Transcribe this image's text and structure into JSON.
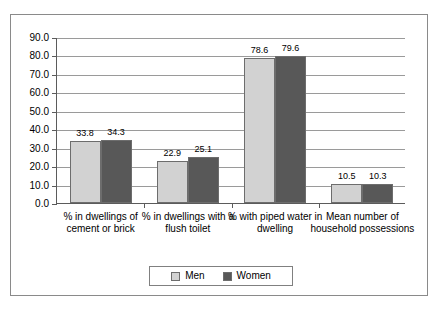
{
  "chart_data": {
    "type": "bar",
    "title": "",
    "subtitle": "",
    "xlabel": "",
    "ylabel": "",
    "ylim": [
      0,
      90
    ],
    "ytick_step": 10,
    "grid": true,
    "legend_position": "bottom",
    "categories": [
      "% in dwellings of cement or brick",
      "% in dwellings with a flush toilet",
      "% with piped water in dwelling",
      "Mean number of household possessions"
    ],
    "ytick_labels": [
      "90.0",
      "80.0",
      "70.0",
      "60.0",
      "50.0",
      "40.0",
      "30.0",
      "20.0",
      "10.0",
      "0.0"
    ],
    "ytick_values": [
      90,
      80,
      70,
      60,
      50,
      40,
      30,
      20,
      10,
      0
    ],
    "series": [
      {
        "name": "Men",
        "color": "#d2d2d2",
        "values": [
          33.8,
          22.9,
          78.6,
          10.5
        ],
        "labels": [
          "33.8",
          "22.9",
          "78.6",
          "10.5"
        ]
      },
      {
        "name": "Women",
        "color": "#585858",
        "values": [
          34.3,
          25.1,
          79.6,
          10.3
        ],
        "labels": [
          "34.3",
          "25.1",
          "79.6",
          "10.3"
        ]
      }
    ]
  },
  "legend": {
    "items": [
      {
        "label": "Men",
        "color": "#d2d2d2"
      },
      {
        "label": "Women",
        "color": "#585858"
      }
    ]
  }
}
